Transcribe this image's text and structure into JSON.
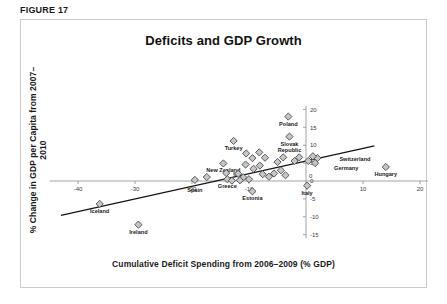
{
  "figure": {
    "caption": "FIGURE 17"
  },
  "chart_data": {
    "type": "scatter",
    "title": "Deficits and GDP Growth",
    "xlabel": "Cumulative Deficit Spending from 2006–2009 (% GDP)",
    "ylabel": "% Change in GDP per Capita from 2007–2010",
    "xlim": [
      -45,
      22
    ],
    "ylim": [
      -16,
      21
    ],
    "xticks": [
      -40,
      -30,
      -20,
      -10,
      0,
      10,
      20
    ],
    "xtick_labels": [
      "-40",
      "-30",
      "-20",
      "-10",
      "0",
      "10",
      "20"
    ],
    "yticks": [
      -15,
      -10,
      -5,
      0,
      5,
      10,
      15,
      20
    ],
    "ytick_labels": [
      "-15",
      "-10",
      "-5",
      "0",
      "5",
      "10",
      "15",
      "20"
    ],
    "grid": false,
    "legend": null,
    "marker": "diamond",
    "marker_fill": "#c6c6c6",
    "marker_edge": "#4a4a4a",
    "trendline": {
      "type": "linear",
      "x_start": -43.0,
      "y_start": -9.6,
      "x_end": 12.0,
      "y_end": 9.8,
      "color": "#141414"
    },
    "points": [
      {
        "label": "Poland",
        "x": -3.1,
        "y": 18.0,
        "label_dx": 0,
        "label_dy": 9
      },
      {
        "label": "Slovak Republic",
        "x": -2.9,
        "y": 12.4,
        "label_dx": 0,
        "label_dy": 9
      },
      {
        "label": "Turkey",
        "x": -12.7,
        "y": 11.2,
        "label_dx": 0,
        "label_dy": 9
      },
      {
        "label": "New Zealand",
        "x": -14.5,
        "y": 4.9,
        "label_dx": 0,
        "label_dy": 9
      },
      {
        "label": "US",
        "x": -14.0,
        "y": 2.2,
        "label_dx": 7,
        "label_dy": 3
      },
      {
        "label": "Switzerland",
        "x": 2.0,
        "y": 6.4,
        "label_dx": 22,
        "label_dy": 3
      },
      {
        "label": "Germany",
        "x": 1.6,
        "y": 5.0,
        "label_dx": 19,
        "label_dy": 7
      },
      {
        "label": "Hungary",
        "x": 14.0,
        "y": 3.9,
        "label_dx": 0,
        "label_dy": 9
      },
      {
        "label": "Spain",
        "x": -19.5,
        "y": 0.3,
        "label_dx": 0,
        "label_dy": 12
      },
      {
        "label": "Greece",
        "x": -13.8,
        "y": 0.5,
        "label_dx": 0,
        "label_dy": 9
      },
      {
        "label": "Estonia",
        "x": -9.4,
        "y": -2.9,
        "label_dx": 0,
        "label_dy": 9
      },
      {
        "label": "Italy",
        "x": 0.2,
        "y": -1.3,
        "label_dx": 0,
        "label_dy": 9
      },
      {
        "label": "Iceland",
        "x": -36.2,
        "y": -6.4,
        "label_dx": 0,
        "label_dy": 9
      },
      {
        "label": "Ireland",
        "x": -29.4,
        "y": -12.2,
        "label_dx": 0,
        "label_dy": 9
      },
      {
        "label": "",
        "x": -10.5,
        "y": 7.7,
        "label_dx": 0,
        "label_dy": 0
      },
      {
        "label": "",
        "x": -9.4,
        "y": 6.4,
        "label_dx": 0,
        "label_dy": 0
      },
      {
        "label": "",
        "x": -8.2,
        "y": 8.0,
        "label_dx": 0,
        "label_dy": 0
      },
      {
        "label": "",
        "x": -7.2,
        "y": 6.5,
        "label_dx": 0,
        "label_dy": 0
      },
      {
        "label": "",
        "x": -10.6,
        "y": 4.6,
        "label_dx": 0,
        "label_dy": 0
      },
      {
        "label": "",
        "x": -9.2,
        "y": 3.4,
        "label_dx": 0,
        "label_dy": 0
      },
      {
        "label": "",
        "x": -8.1,
        "y": 4.3,
        "label_dx": 0,
        "label_dy": 0
      },
      {
        "label": "",
        "x": -11.9,
        "y": 2.0,
        "label_dx": 0,
        "label_dy": 0
      },
      {
        "label": "",
        "x": -11.0,
        "y": 1.0,
        "label_dx": 0,
        "label_dy": 0
      },
      {
        "label": "",
        "x": -11.6,
        "y": 0.2,
        "label_dx": 0,
        "label_dy": 0
      },
      {
        "label": "",
        "x": -10.0,
        "y": 0.5,
        "label_dx": 0,
        "label_dy": 0
      },
      {
        "label": "",
        "x": -7.6,
        "y": 1.9,
        "label_dx": 0,
        "label_dy": 0
      },
      {
        "label": "",
        "x": -6.5,
        "y": 1.2,
        "label_dx": 0,
        "label_dy": 0
      },
      {
        "label": "",
        "x": -5.6,
        "y": 2.1,
        "label_dx": 0,
        "label_dy": 0
      },
      {
        "label": "",
        "x": -4.4,
        "y": 3.0,
        "label_dx": 0,
        "label_dy": 0
      },
      {
        "label": "",
        "x": -3.6,
        "y": 1.6,
        "label_dx": 0,
        "label_dy": 0
      },
      {
        "label": "",
        "x": -5.0,
        "y": 5.3,
        "label_dx": 0,
        "label_dy": 0
      },
      {
        "label": "",
        "x": -4.0,
        "y": 6.6,
        "label_dx": 0,
        "label_dy": 0
      },
      {
        "label": "",
        "x": -2.0,
        "y": 5.6,
        "label_dx": 0,
        "label_dy": 0
      },
      {
        "label": "",
        "x": -1.2,
        "y": 6.6,
        "label_dx": 0,
        "label_dy": 0
      },
      {
        "label": "",
        "x": 0.4,
        "y": 5.6,
        "label_dx": 0,
        "label_dy": 0
      },
      {
        "label": "",
        "x": 1.2,
        "y": 6.9,
        "label_dx": 0,
        "label_dy": 0
      },
      {
        "label": "",
        "x": -13.0,
        "y": 0.1,
        "label_dx": 0,
        "label_dy": 0
      },
      {
        "label": "",
        "x": -17.4,
        "y": 1.1,
        "label_dx": 0,
        "label_dy": 0
      }
    ]
  }
}
